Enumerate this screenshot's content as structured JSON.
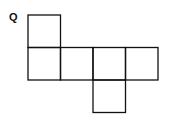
{
  "diagram": {
    "type": "cube-net",
    "label": "Q",
    "stroke_color": "#111111",
    "cell_size": 32.5,
    "squares": [
      {
        "id": "top",
        "col": 0,
        "row": 0
      },
      {
        "id": "middle-1",
        "col": 0,
        "row": 1
      },
      {
        "id": "middle-2",
        "col": 1,
        "row": 1
      },
      {
        "id": "middle-3",
        "col": 2,
        "row": 1
      },
      {
        "id": "middle-4",
        "col": 3,
        "row": 1
      },
      {
        "id": "bottom",
        "col": 2,
        "row": 2
      }
    ]
  }
}
